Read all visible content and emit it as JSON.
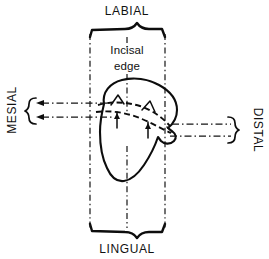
{
  "figure": {
    "background_color": "#ffffff",
    "line_color": "#0d0d0d"
  },
  "labels": {
    "labial": "LABIAL",
    "lingual": "LINGUAL",
    "mesial": "MESIAL",
    "distal": "DISTAL",
    "incisal_edge_line1": "Incisal",
    "incisal_edge_line2": "edge"
  },
  "annotations": {
    "mamelon_count": 2,
    "incisal_edge_pointer": "vertical dash-dot leader from label to incisal edge"
  }
}
